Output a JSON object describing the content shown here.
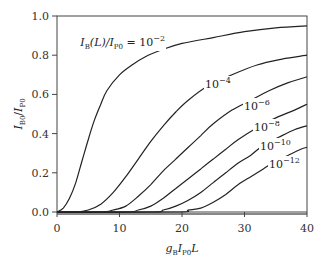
{
  "chart_data": {
    "type": "line",
    "title": "",
    "xlabel": "g_B I_P0 L",
    "ylabel": "I_B0 / I_P0",
    "xlim": [
      0,
      40
    ],
    "ylim": [
      0,
      1.0
    ],
    "xticks": [
      "0",
      "10",
      "20",
      "30",
      "40"
    ],
    "yticks": [
      "0.0",
      "0.2",
      "0.4",
      "0.6",
      "0.8",
      "1.0"
    ],
    "grid": false,
    "legend": "inline labels on curves",
    "annotation_prefix": "I_B(L)/I_P0 =",
    "series": [
      {
        "name": "10^-2",
        "base": "10",
        "exp": "−2",
        "x": [
          0,
          1,
          2,
          3,
          4,
          5,
          6,
          7,
          8,
          10,
          12,
          14,
          17,
          20,
          25,
          30,
          35,
          40
        ],
        "y": [
          0.0,
          0.02,
          0.07,
          0.15,
          0.26,
          0.37,
          0.47,
          0.55,
          0.62,
          0.7,
          0.75,
          0.79,
          0.83,
          0.86,
          0.89,
          0.92,
          0.94,
          0.95
        ]
      },
      {
        "name": "10^-4",
        "base": "10",
        "exp": "−4",
        "x": [
          0,
          3,
          5,
          7,
          9,
          11,
          13,
          15,
          17,
          19,
          21,
          24,
          28,
          32,
          36,
          40
        ],
        "y": [
          0.0,
          0.0,
          0.01,
          0.04,
          0.1,
          0.18,
          0.27,
          0.36,
          0.44,
          0.51,
          0.57,
          0.64,
          0.7,
          0.75,
          0.78,
          0.8
        ]
      },
      {
        "name": "10^-6",
        "base": "10",
        "exp": "−6",
        "x": [
          0,
          7,
          9,
          11,
          13,
          15,
          17,
          19,
          21,
          23,
          25,
          28,
          31,
          34,
          37,
          40
        ],
        "y": [
          0.0,
          0.0,
          0.01,
          0.03,
          0.08,
          0.14,
          0.21,
          0.27,
          0.33,
          0.39,
          0.45,
          0.52,
          0.57,
          0.62,
          0.66,
          0.69
        ]
      },
      {
        "name": "10^-8",
        "base": "10",
        "exp": "−8",
        "x": [
          0,
          11,
          13,
          15,
          17,
          19,
          21,
          23,
          25,
          27,
          29,
          32,
          35,
          38,
          40
        ],
        "y": [
          0.0,
          0.0,
          0.01,
          0.03,
          0.07,
          0.12,
          0.17,
          0.22,
          0.27,
          0.32,
          0.37,
          0.43,
          0.48,
          0.52,
          0.55
        ]
      },
      {
        "name": "10^-10",
        "base": "10",
        "exp": "−10",
        "x": [
          0,
          15,
          17,
          19,
          21,
          23,
          25,
          27,
          29,
          31,
          33,
          36,
          38,
          40
        ],
        "y": [
          0.0,
          0.0,
          0.01,
          0.03,
          0.06,
          0.1,
          0.15,
          0.2,
          0.25,
          0.29,
          0.34,
          0.39,
          0.42,
          0.44
        ]
      },
      {
        "name": "10^-12",
        "base": "10",
        "exp": "−12",
        "x": [
          0,
          19,
          21,
          23,
          25,
          27,
          29,
          31,
          33,
          35,
          37,
          39,
          40
        ],
        "y": [
          0.0,
          0.0,
          0.01,
          0.02,
          0.05,
          0.09,
          0.14,
          0.18,
          0.22,
          0.26,
          0.29,
          0.32,
          0.33
        ]
      }
    ],
    "labels": [
      {
        "series": 0,
        "x": 123,
        "y": 46
      },
      {
        "series": 1,
        "x": 205,
        "y": 88
      },
      {
        "series": 2,
        "x": 244,
        "y": 110
      },
      {
        "series": 3,
        "x": 254,
        "y": 131
      },
      {
        "series": 4,
        "x": 260,
        "y": 150
      },
      {
        "series": 5,
        "x": 269,
        "y": 168
      }
    ]
  },
  "axes": {
    "x_label_parts": {
      "g": "g",
      "g_sub": "B",
      "i": "I",
      "i_sub": "P0",
      "l": "L"
    },
    "y_label_parts": {
      "i1": "I",
      "i1_sub": "B0",
      "slash": "/",
      "i2": "I",
      "i2_sub": "P0"
    },
    "annotation_parts": {
      "i": "I",
      "i_sub": "B",
      "mid": "(L)/",
      "i2": "I",
      "i2_sub": "P0",
      "eq": " = "
    }
  }
}
